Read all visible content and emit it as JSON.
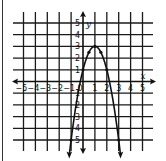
{
  "chart_data": {
    "type": "line",
    "title": "",
    "xlabel": "x",
    "ylabel": "y",
    "xlim": [
      -5,
      5
    ],
    "ylim": [
      -5,
      5
    ],
    "grid": true,
    "x_ticks": [
      "-5",
      "-4",
      "-3",
      "-2",
      "-1",
      "0",
      "1",
      "2",
      "3",
      "4",
      "5"
    ],
    "y_ticks": [
      "5",
      "4",
      "3",
      "2",
      "1",
      "-1",
      "-2",
      "-3",
      "-4",
      "-5"
    ],
    "series": [
      {
        "name": "parabola",
        "equation": "y = -2(x - 1)^2 + 3",
        "x_range": [
          -1.15,
          3.15
        ],
        "marked_points": [
          {
            "x": 0.5,
            "y": 2.5
          },
          {
            "x": 1,
            "y": 3
          },
          {
            "x": 1.5,
            "y": 2.5
          },
          {
            "x": 0,
            "y": 1
          },
          {
            "x": 2,
            "y": 1
          },
          {
            "x": -1,
            "y": -5
          },
          {
            "x": 3,
            "y": -5
          }
        ],
        "color": "#111111"
      }
    ]
  }
}
